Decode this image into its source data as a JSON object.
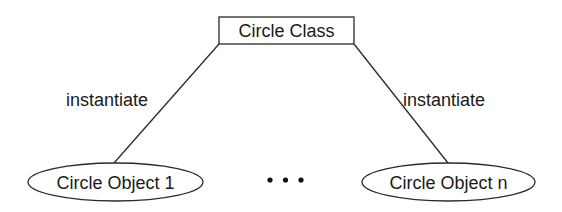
{
  "class_node": {
    "label": "Circle Class",
    "shape": "rectangle"
  },
  "edges": [
    {
      "label": "instantiate",
      "from": "Circle Class",
      "to": "Circle Object 1"
    },
    {
      "label": "instantiate",
      "from": "Circle Class",
      "to": "Circle Object n"
    }
  ],
  "object_nodes": [
    {
      "label": "Circle Object 1",
      "shape": "ellipse"
    },
    {
      "label": "Circle Object n",
      "shape": "ellipse"
    }
  ],
  "ellipsis": "• • •",
  "colors": {
    "stroke": "#2a2a2a",
    "text": "#1a1a1a",
    "background": "#ffffff"
  }
}
